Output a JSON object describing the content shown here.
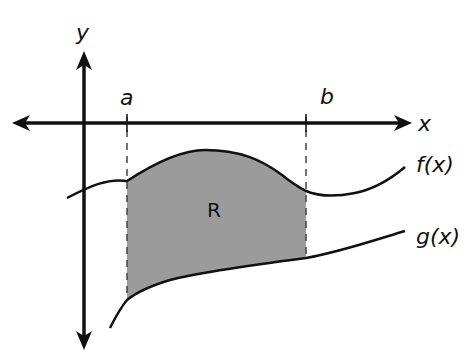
{
  "diagram": {
    "type": "area-between-curves",
    "colors": {
      "stroke": "#111111",
      "region_fill": "#9b9b9b",
      "background": "#ffffff"
    },
    "axes": {
      "x_label": "x",
      "y_label": "y"
    },
    "bounds": {
      "lower_label": "a",
      "upper_label": "b"
    },
    "curves": [
      {
        "name": "f",
        "label": "f(x)",
        "position": "upper"
      },
      {
        "name": "g",
        "label": "g(x)",
        "position": "lower"
      }
    ],
    "region": {
      "label": "R",
      "description": "Shaded region between f(x) above and g(x) below, from x = a to x = b"
    }
  }
}
